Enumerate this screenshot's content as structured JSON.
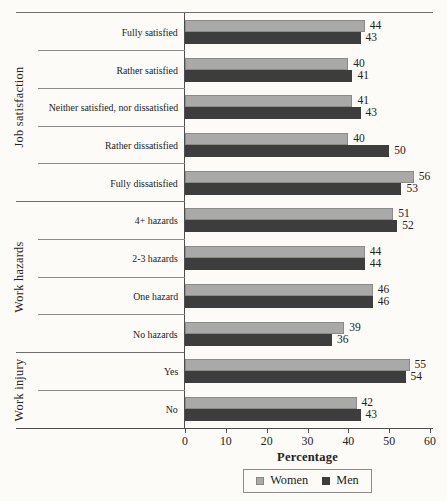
{
  "chart_data": {
    "type": "bar",
    "orientation": "horizontal",
    "xlabel": "Percentage",
    "xlim": [
      0,
      60
    ],
    "xticks": [
      0,
      10,
      20,
      30,
      40,
      50,
      60
    ],
    "grid": false,
    "legend_position": "bottom",
    "groups": [
      {
        "label": "Job satisfaction",
        "categories": [
          "Fully satisfied",
          "Rather satisfied",
          "Neither satisfied, nor dissatisfied",
          "Rather dissatisfied",
          "Fully dissatisfied"
        ]
      },
      {
        "label": "Work hazards",
        "categories": [
          "4+ hazards",
          "2-3 hazards",
          "One hazard",
          "No hazards"
        ]
      },
      {
        "label": "Work injury",
        "categories": [
          "Yes",
          "No"
        ]
      }
    ],
    "categories": [
      "Fully satisfied",
      "Rather satisfied",
      "Neither satisfied, nor dissatisfied",
      "Rather dissatisfied",
      "Fully dissatisfied",
      "4+ hazards",
      "2-3 hazards",
      "One hazard",
      "No hazards",
      "Yes",
      "No"
    ],
    "series": [
      {
        "name": "Women",
        "color": "#a9a9a7",
        "values": [
          44,
          40,
          41,
          40,
          56,
          51,
          44,
          46,
          39,
          55,
          42
        ]
      },
      {
        "name": "Men",
        "color": "#3d3d3d",
        "values": [
          43,
          41,
          43,
          50,
          53,
          52,
          44,
          46,
          36,
          54,
          43
        ]
      }
    ]
  },
  "colors": {
    "background": "#fcfbf7",
    "axis_line": "#4d4d4d",
    "group_boundary_line": "#6e6e6e",
    "category_separator_line": "#8c8c8c",
    "text": "#23221f"
  }
}
